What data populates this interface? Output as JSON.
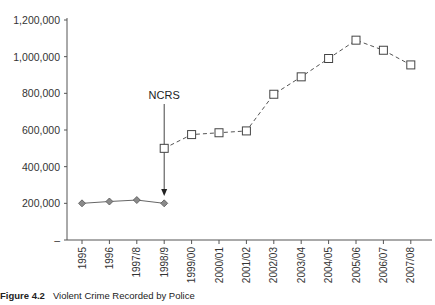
{
  "chart_data": {
    "type": "line",
    "title": "",
    "xlabel": "",
    "ylabel": "",
    "ylim": [
      0,
      1200000
    ],
    "grid": false,
    "legend": null,
    "y_ticks": [
      {
        "value": 0,
        "label": "–"
      },
      {
        "value": 200000,
        "label": "200,000"
      },
      {
        "value": 400000,
        "label": "400,000"
      },
      {
        "value": 600000,
        "label": "600,000"
      },
      {
        "value": 800000,
        "label": "800,000"
      },
      {
        "value": 1000000,
        "label": "1,000,000"
      },
      {
        "value": 1200000,
        "label": "1,200,000"
      }
    ],
    "categories": [
      "1995",
      "1996",
      "1997/8",
      "1998/9",
      "1999/00",
      "2000/01",
      "2001/02",
      "2002/03",
      "2003/04",
      "2004/05",
      "2005/06",
      "2006/07",
      "2007/08"
    ],
    "series": [
      {
        "name": "Before NCRS",
        "marker": "diamond",
        "line_style": "solid",
        "color": "#808080",
        "values": [
          200000,
          210000,
          218000,
          200000,
          null,
          null,
          null,
          null,
          null,
          null,
          null,
          null,
          null
        ]
      },
      {
        "name": "After NCRS",
        "marker": "square-open",
        "line_style": "dashed",
        "color": "#444444",
        "values": [
          null,
          null,
          null,
          500000,
          575000,
          585000,
          595000,
          795000,
          890000,
          990000,
          1090000,
          1035000,
          955000
        ]
      }
    ],
    "annotations": [
      {
        "text": "NCRS",
        "category": "1998/9",
        "type": "arrow-down"
      }
    ]
  },
  "caption": {
    "label": "Figure 4.2",
    "text": "Violent Crime Recorded by Police"
  }
}
